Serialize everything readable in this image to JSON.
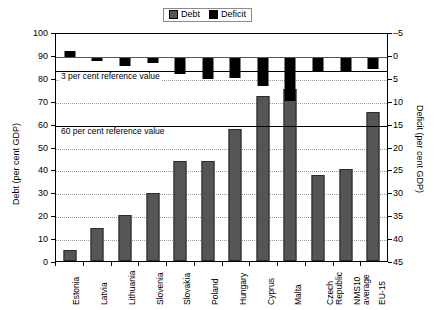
{
  "chart_data": {
    "type": "bar",
    "title": "",
    "xlabel": "",
    "ylabel": "Debt (per cent GDP)",
    "y2label": "Deficit (per cent GDP)",
    "ylim": [
      0,
      100
    ],
    "y2lim": [
      45,
      -5
    ],
    "grid": true,
    "legend_position": "top-center",
    "categories": [
      "Estonia",
      "Latvia",
      "Lithuania",
      "Slovenia",
      "Slovakia",
      "Poland",
      "Hungary",
      "Cyprus",
      "Malta",
      "Czech Republic",
      "NMS10 average",
      "EU-15"
    ],
    "category_lines": [
      [
        "Estonia"
      ],
      [
        "Latvia"
      ],
      [
        "Lithuania"
      ],
      [
        "Slovenia"
      ],
      [
        "Slovakia"
      ],
      [
        "Poland"
      ],
      [
        "Hungary"
      ],
      [
        "Cyprus"
      ],
      [
        "Malta"
      ],
      [
        "Czech",
        "Republic"
      ],
      [
        "NMS10",
        "average"
      ],
      [
        "EU-15"
      ]
    ],
    "series": [
      {
        "name": "Debt",
        "axis": "left",
        "color": "#555555",
        "values": [
          5.0,
          14.5,
          20.0,
          29.5,
          43.5,
          43.5,
          57.5,
          72.0,
          75.0,
          37.5,
          40.0,
          65.0
        ]
      },
      {
        "name": "Deficit",
        "axis": "right",
        "color": "#000000",
        "values": [
          -1.3,
          0.8,
          1.9,
          1.4,
          3.7,
          4.8,
          4.5,
          6.3,
          9.7,
          3.0,
          3.0,
          2.6
        ]
      }
    ],
    "left_ticks": [
      "100",
      "90",
      "80",
      "70",
      "60",
      "50",
      "40",
      "30",
      "20",
      "10",
      "0"
    ],
    "right_ticks": [
      "–5",
      "0",
      "5",
      "10",
      "15",
      "20",
      "25",
      "30",
      "35",
      "40",
      "45"
    ],
    "reference_lines": [
      {
        "label": "3 per cent reference value",
        "axis": "right",
        "value": 3
      },
      {
        "label": "60 per cent reference value",
        "axis": "left",
        "value": 60
      }
    ],
    "legend": [
      {
        "label": "Debt",
        "color": "#555555"
      },
      {
        "label": "Deficit",
        "color": "#000000"
      }
    ]
  }
}
